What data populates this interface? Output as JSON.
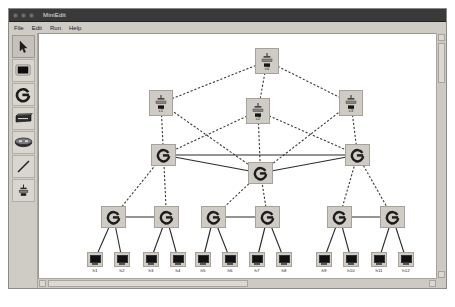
{
  "window": {
    "title": "MiniEdit",
    "menu": [
      "File",
      "Edit",
      "Run",
      "Help"
    ],
    "controls": [
      "close-dot",
      "minimize-dot",
      "zoom-dot"
    ]
  },
  "toolbar": {
    "tools": [
      {
        "name": "select-tool",
        "icon": "cursor-arrow-icon",
        "selected": true
      },
      {
        "name": "host-tool",
        "icon": "host-icon",
        "selected": false
      },
      {
        "name": "switch-tool",
        "icon": "openflow-switch-icon",
        "selected": false
      },
      {
        "name": "legacy-router-tool",
        "icon": "legacy-router-icon",
        "selected": false
      },
      {
        "name": "legacy-switch-tool",
        "icon": "legacy-switch-icon",
        "selected": false
      },
      {
        "name": "link-tool",
        "icon": "link-line-icon",
        "selected": false
      },
      {
        "name": "controller-tool",
        "icon": "controller-icon",
        "selected": false
      }
    ]
  },
  "caption": "图 3  网络拓扑示意图",
  "colors": {
    "node_fill": "#cfcbc5",
    "node_border": "#a6a19a",
    "link_solid": "#2b2b2b",
    "link_dashed": "#3a3a3a",
    "canvas": "#ffffff",
    "chrome": "#d6d2cc",
    "titlebar": "#3a3a3a"
  },
  "topology": {
    "nodes": [
      {
        "id": "c0",
        "label": "c0",
        "type": "controller",
        "x": 216,
        "y": 14
      },
      {
        "id": "c1",
        "label": "c1",
        "type": "controller",
        "x": 110,
        "y": 56
      },
      {
        "id": "c2",
        "label": "c2",
        "type": "controller",
        "x": 207,
        "y": 64
      },
      {
        "id": "c3",
        "label": "c3",
        "type": "controller",
        "x": 300,
        "y": 56
      },
      {
        "id": "s1",
        "label": "s1",
        "type": "switch",
        "x": 112,
        "y": 110
      },
      {
        "id": "s4",
        "label": "s4",
        "type": "switch",
        "x": 209,
        "y": 128
      },
      {
        "id": "s7",
        "label": "s7",
        "type": "switch",
        "x": 306,
        "y": 110
      },
      {
        "id": "s2",
        "label": "s2",
        "type": "switch",
        "x": 62,
        "y": 172
      },
      {
        "id": "s3",
        "label": "s3",
        "type": "switch",
        "x": 115,
        "y": 172
      },
      {
        "id": "s5",
        "label": "s5",
        "type": "switch",
        "x": 162,
        "y": 172
      },
      {
        "id": "s6",
        "label": "s6",
        "type": "switch",
        "x": 216,
        "y": 172
      },
      {
        "id": "s8",
        "label": "s8",
        "type": "switch",
        "x": 288,
        "y": 172
      },
      {
        "id": "s9",
        "label": "s9",
        "type": "switch",
        "x": 341,
        "y": 172
      },
      {
        "id": "h1",
        "label": "h1",
        "type": "host",
        "x": 48,
        "y": 218
      },
      {
        "id": "h2",
        "label": "h2",
        "type": "host",
        "x": 75,
        "y": 218
      },
      {
        "id": "h3",
        "label": "h3",
        "type": "host",
        "x": 104,
        "y": 218
      },
      {
        "id": "h4",
        "label": "h4",
        "type": "host",
        "x": 131,
        "y": 218
      },
      {
        "id": "h5",
        "label": "h5",
        "type": "host",
        "x": 156,
        "y": 218
      },
      {
        "id": "h6",
        "label": "h6",
        "type": "host",
        "x": 183,
        "y": 218
      },
      {
        "id": "h7",
        "label": "h7",
        "type": "host",
        "x": 210,
        "y": 218
      },
      {
        "id": "h8",
        "label": "h8",
        "type": "host",
        "x": 237,
        "y": 218
      },
      {
        "id": "h9",
        "label": "h9",
        "type": "host",
        "x": 277,
        "y": 218
      },
      {
        "id": "h10",
        "label": "h10",
        "type": "host",
        "x": 304,
        "y": 218
      },
      {
        "id": "h11",
        "label": "h11",
        "type": "host",
        "x": 332,
        "y": 218
      },
      {
        "id": "h12",
        "label": "h12",
        "type": "host",
        "x": 359,
        "y": 218
      }
    ],
    "links": [
      {
        "from": "c0",
        "to": "c1",
        "style": "dashed"
      },
      {
        "from": "c0",
        "to": "c2",
        "style": "dashed"
      },
      {
        "from": "c0",
        "to": "c3",
        "style": "dashed"
      },
      {
        "from": "c1",
        "to": "s1",
        "style": "dashed"
      },
      {
        "from": "c2",
        "to": "s4",
        "style": "dashed"
      },
      {
        "from": "c3",
        "to": "s7",
        "style": "dashed"
      },
      {
        "from": "c1",
        "to": "s4",
        "style": "dashed"
      },
      {
        "from": "c3",
        "to": "s4",
        "style": "dashed"
      },
      {
        "from": "c2",
        "to": "s1",
        "style": "dashed"
      },
      {
        "from": "c2",
        "to": "s7",
        "style": "dashed"
      },
      {
        "from": "s1",
        "to": "s7",
        "style": "solid"
      },
      {
        "from": "s1",
        "to": "s4",
        "style": "solid"
      },
      {
        "from": "s4",
        "to": "s7",
        "style": "solid"
      },
      {
        "from": "s1",
        "to": "s2",
        "style": "dashed"
      },
      {
        "from": "s1",
        "to": "s3",
        "style": "dashed"
      },
      {
        "from": "s4",
        "to": "s5",
        "style": "dashed"
      },
      {
        "from": "s4",
        "to": "s6",
        "style": "dashed"
      },
      {
        "from": "s7",
        "to": "s8",
        "style": "dashed"
      },
      {
        "from": "s7",
        "to": "s9",
        "style": "dashed"
      },
      {
        "from": "s2",
        "to": "s3",
        "style": "solid"
      },
      {
        "from": "s5",
        "to": "s6",
        "style": "solid"
      },
      {
        "from": "s8",
        "to": "s9",
        "style": "solid"
      },
      {
        "from": "s2",
        "to": "h1",
        "style": "solid"
      },
      {
        "from": "s2",
        "to": "h2",
        "style": "solid"
      },
      {
        "from": "s3",
        "to": "h3",
        "style": "solid"
      },
      {
        "from": "s3",
        "to": "h4",
        "style": "solid"
      },
      {
        "from": "s5",
        "to": "h5",
        "style": "solid"
      },
      {
        "from": "s5",
        "to": "h6",
        "style": "solid"
      },
      {
        "from": "s6",
        "to": "h7",
        "style": "solid"
      },
      {
        "from": "s6",
        "to": "h8",
        "style": "solid"
      },
      {
        "from": "s8",
        "to": "h9",
        "style": "solid"
      },
      {
        "from": "s8",
        "to": "h10",
        "style": "solid"
      },
      {
        "from": "s9",
        "to": "h11",
        "style": "solid"
      },
      {
        "from": "s9",
        "to": "h12",
        "style": "solid"
      }
    ]
  }
}
